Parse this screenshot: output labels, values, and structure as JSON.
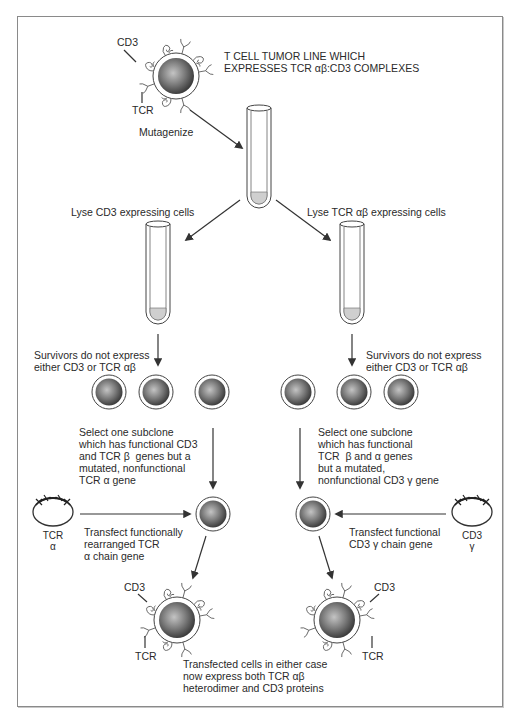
{
  "figure": {
    "top_cell": {
      "cd3_label": "CD3",
      "tcr_label": "TCR",
      "title_line1": "T CELL TUMOR LINE WHICH",
      "title_line2": "EXPRESSES TCR αβ:CD3 COMPLEXES"
    },
    "mutagenize_label": "Mutagenize",
    "left_branch": {
      "lyse_label": "Lyse CD3 expressing cells",
      "survivors_line1": "Survivors do not express",
      "survivors_line2": "either CD3 or TCR αβ",
      "select_lines": [
        "Select one subclone",
        "which has functional CD3",
        "and TCR β  genes but a",
        "mutated, nonfunctional",
        "TCR α gene"
      ],
      "plasmid_label_line1": "TCR",
      "plasmid_label_line2": "α",
      "transfect_lines": [
        "Transfect functionally",
        "rearranged TCR",
        "α chain gene"
      ],
      "result_cd3_label": "CD3",
      "result_tcr_label": "TCR"
    },
    "right_branch": {
      "lyse_label": "Lyse TCR αβ expressing cells",
      "survivors_line1": "Survivors do not express",
      "survivors_line2": "either CD3 or TCR αβ",
      "select_lines": [
        "Select one subclone",
        "which has functional",
        "TCR  β and α genes",
        "but a mutated,",
        "nonfunctional CD3 γ gene"
      ],
      "plasmid_label_line1": "CD3",
      "plasmid_label_line2": "γ",
      "transfect_lines": [
        "Transfect functional",
        "CD3 γ chain gene"
      ],
      "result_cd3_label": "CD3",
      "result_tcr_label": "TCR"
    },
    "conclusion_lines": [
      "Transfected cells in either case",
      "now express both TCR αβ",
      "heterodimer and CD3 proteins"
    ],
    "colors": {
      "cell_dark": "#3a3a3a",
      "cell_light": "#b8b8b8",
      "tube_liquid": "#cfcfcf",
      "line": "#3a3a3a",
      "frame_border": "#8a8a8a"
    }
  }
}
